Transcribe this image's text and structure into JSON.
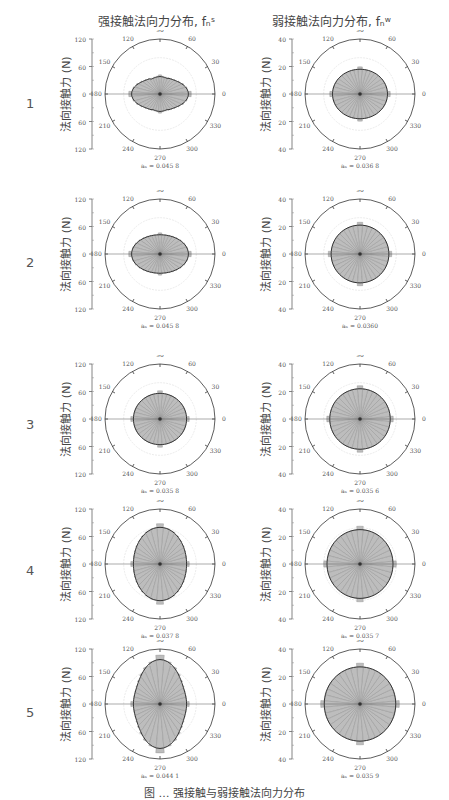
{
  "columns": [
    {
      "title": "强接触法向力分布, fₙˢ"
    },
    {
      "title": "弱接触法向力分布, fₙʷ"
    }
  ],
  "rows": [
    {
      "label": "1"
    },
    {
      "label": "2"
    },
    {
      "label": "3"
    },
    {
      "label": "4"
    },
    {
      "label": "5"
    }
  ],
  "axis_label": "法向接触力 (N)",
  "angle_ticks": [
    "0",
    "30",
    "60",
    "90",
    "120",
    "150",
    "180",
    "210",
    "240",
    "270",
    "300",
    "330"
  ],
  "caption": "图 … 强接触与弱接触法向力分布",
  "chart_data": [
    {
      "type": "polar",
      "row": 1,
      "column": "strong",
      "title": "强接触法向力分布",
      "radial_max": 120,
      "radial_ticks": [
        120,
        60,
        0,
        60,
        120
      ],
      "anisotropy_label": "aₙ = 0.045 8",
      "anisotropy": 0.0458,
      "rx": 62,
      "ry": 38,
      "shape": "peanut-horizontal"
    },
    {
      "type": "polar",
      "row": 1,
      "column": "weak",
      "title": "弱接触法向力分布",
      "radial_max": 40,
      "radial_ticks": [
        40,
        20,
        0,
        20,
        40
      ],
      "anisotropy_label": "aₙ = 0.036 8",
      "anisotropy": 0.0368,
      "rx": 20,
      "ry": 18,
      "shape": "ellipse"
    },
    {
      "type": "polar",
      "row": 2,
      "column": "strong",
      "radial_max": 120,
      "radial_ticks": [
        120,
        60,
        0,
        60,
        120
      ],
      "anisotropy_label": "aₙ = 0.045 8",
      "anisotropy": 0.0458,
      "rx": 62,
      "ry": 42,
      "shape": "ellipse"
    },
    {
      "type": "polar",
      "row": 2,
      "column": "weak",
      "radial_max": 40,
      "radial_ticks": [
        40,
        20,
        0,
        20,
        40
      ],
      "anisotropy_label": "aₙ = 0.0360",
      "anisotropy": 0.036,
      "rx": 21,
      "ry": 21,
      "shape": "circle"
    },
    {
      "type": "polar",
      "row": 3,
      "column": "strong",
      "radial_max": 120,
      "radial_ticks": [
        120,
        60,
        0,
        60,
        120
      ],
      "anisotropy_label": "aₙ = 0.035 8",
      "anisotropy": 0.0358,
      "rx": 58,
      "ry": 56,
      "shape": "circle"
    },
    {
      "type": "polar",
      "row": 3,
      "column": "weak",
      "radial_max": 40,
      "radial_ticks": [
        40,
        20,
        0,
        20,
        40
      ],
      "anisotropy_label": "aₙ = 0.035 6",
      "anisotropy": 0.0356,
      "rx": 22,
      "ry": 22,
      "shape": "circle"
    },
    {
      "type": "polar",
      "row": 4,
      "column": "strong",
      "radial_max": 120,
      "radial_ticks": [
        120,
        60,
        0,
        60,
        120
      ],
      "anisotropy_label": "aₙ = 0.037 8",
      "anisotropy": 0.0378,
      "rx": 58,
      "ry": 80,
      "shape": "ellipse-vertical"
    },
    {
      "type": "polar",
      "row": 4,
      "column": "weak",
      "radial_max": 40,
      "radial_ticks": [
        40,
        20,
        0,
        20,
        40
      ],
      "anisotropy_label": "aₙ = 0.035 7",
      "anisotropy": 0.0357,
      "rx": 24,
      "ry": 25,
      "shape": "circle"
    },
    {
      "type": "polar",
      "row": 5,
      "column": "strong",
      "radial_max": 120,
      "radial_ticks": [
        120,
        60,
        0,
        60,
        120
      ],
      "anisotropy_label": "aₙ = 0.044 1",
      "anisotropy": 0.0441,
      "rx": 58,
      "ry": 97,
      "shape": "peanut-vertical"
    },
    {
      "type": "polar",
      "row": 5,
      "column": "weak",
      "radial_max": 40,
      "radial_ticks": [
        40,
        20,
        0,
        20,
        40
      ],
      "anisotropy_label": "aₙ = 0.035 9",
      "anisotropy": 0.0359,
      "rx": 26,
      "ry": 27,
      "shape": "circle"
    }
  ]
}
